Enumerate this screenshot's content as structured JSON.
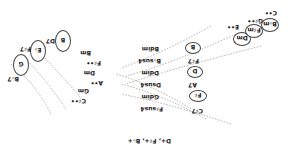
{
  "diagram": {
    "orientation": "rotated-180",
    "center_column": [
      "Bdim",
      "B♭sus4",
      "Ddim",
      "Dsus4",
      "Gdim",
      "F♯sus4"
    ],
    "footer": "D+, F♯+, B♭+",
    "left_arc_labels": [
      "Bm",
      "F♯••",
      "Dm",
      "A••",
      "Gm",
      "C♯••"
    ],
    "left_nodes": [
      {
        "node": "B",
        "label": "D7"
      },
      {
        "node": "E♭",
        "label": "F♯7"
      },
      {
        "node": "G",
        "label": "B♭7"
      }
    ],
    "right_nodes": [
      {
        "node": "Dm",
        "label": "E••"
      },
      {
        "node": "F♯m",
        "label": "G♯••"
      },
      {
        "node": "B♭m",
        "label": "C••"
      }
    ],
    "center_right_nodes": [
      {
        "node": "B",
        "label": "F♯7"
      },
      {
        "node": "D",
        "label": "A7"
      },
      {
        "node": "F♯",
        "label": "C♯7"
      }
    ],
    "colors": {
      "line": "#888888",
      "text": "#1a1a1a",
      "node_border": "#444444"
    }
  }
}
